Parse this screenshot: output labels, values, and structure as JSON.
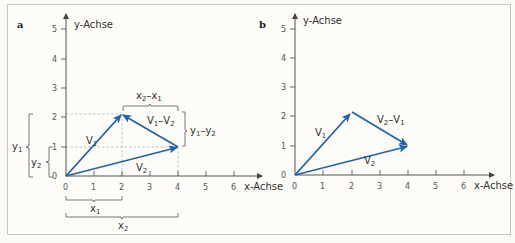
{
  "panels": [
    {
      "id": "a",
      "label": "a",
      "y_axis_label": "y-Achse",
      "x_axis_label": "x-Achse",
      "x_ticks": [
        "0",
        "1",
        "2",
        "3",
        "4",
        "5",
        "6"
      ],
      "y_ticks": [
        "0",
        "1",
        "2",
        "3",
        "4",
        "5"
      ],
      "vectors": [
        {
          "name": "V1",
          "label": "V",
          "sub": "1",
          "from": [
            0,
            0
          ],
          "to": [
            2,
            2.1
          ]
        },
        {
          "name": "V2",
          "label": "V",
          "sub": "2",
          "from": [
            0,
            0
          ],
          "to": [
            4,
            1
          ]
        },
        {
          "name": "V1-V2",
          "label_a": "V",
          "sub_a": "1",
          "op": "–",
          "label_b": "V",
          "sub_b": "2",
          "from": [
            4,
            1
          ],
          "to": [
            2,
            2.1
          ]
        }
      ],
      "braces": {
        "x2_minus_x1": {
          "a": "x",
          "sa": "2",
          "op": "–",
          "b": "x",
          "sb": "1"
        },
        "y1_minus_y2": {
          "a": "y",
          "sa": "1",
          "op": "–",
          "b": "y",
          "sb": "2"
        },
        "y1": {
          "a": "y",
          "sa": "1"
        },
        "y2": {
          "a": "y",
          "sa": "2"
        },
        "x1": {
          "a": "x",
          "sa": "1"
        },
        "x2": {
          "a": "x",
          "sa": "2"
        }
      }
    },
    {
      "id": "b",
      "label": "b",
      "y_axis_label": "y-Achse",
      "x_axis_label": "x-Achse",
      "x_ticks": [
        "0",
        "1",
        "2",
        "3",
        "4",
        "5",
        "6"
      ],
      "y_ticks": [
        "0",
        "1",
        "2",
        "3",
        "4",
        "5"
      ],
      "vectors": [
        {
          "name": "V1",
          "label": "V",
          "sub": "1",
          "from": [
            0,
            0
          ],
          "to": [
            2,
            2.1
          ]
        },
        {
          "name": "V2",
          "label": "V",
          "sub": "2",
          "from": [
            0,
            0
          ],
          "to": [
            4,
            1
          ]
        },
        {
          "name": "V2-V1",
          "label_a": "V",
          "sub_a": "2",
          "op": "–",
          "label_b": "V",
          "sub_b": "1",
          "from": [
            2,
            2.1
          ],
          "to": [
            4,
            1
          ]
        }
      ]
    }
  ],
  "colors": {
    "vector": "#2563a8",
    "axis": "#444444",
    "guide": "#9a9a9a",
    "frame": "#c9c6bf"
  }
}
